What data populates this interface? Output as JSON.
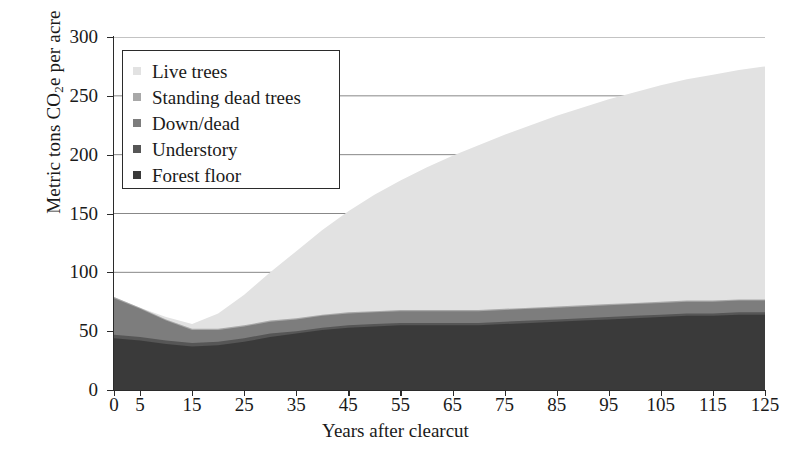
{
  "chart_data": {
    "type": "area",
    "stacked": true,
    "title": "",
    "xlabel": "Years after clearcut",
    "ylabel": "Metric tons CO2e per acre",
    "ylabel_parts": {
      "pre": "Metric tons CO",
      "sub": "2",
      "post": "e per acre"
    },
    "xlim": [
      0,
      125
    ],
    "ylim": [
      0,
      300
    ],
    "yticks": [
      0,
      50,
      100,
      150,
      200,
      250,
      300
    ],
    "xticks": [
      0,
      5,
      15,
      25,
      35,
      45,
      55,
      65,
      75,
      85,
      95,
      105,
      115,
      125
    ],
    "grid": "horizontal",
    "legend_position": "upper-left-inside",
    "x": [
      0,
      5,
      10,
      15,
      20,
      25,
      30,
      35,
      40,
      45,
      50,
      55,
      60,
      65,
      70,
      75,
      80,
      85,
      90,
      95,
      100,
      105,
      110,
      115,
      120,
      125
    ],
    "series": [
      {
        "name": "Forest floor",
        "color": "#3a3a3a",
        "values": [
          44,
          42,
          39,
          37,
          38,
          41,
          45,
          48,
          51,
          53,
          54,
          55,
          55,
          55,
          55,
          56,
          57,
          58,
          59,
          60,
          61,
          62,
          63,
          63,
          64,
          64
        ]
      },
      {
        "name": "Understory",
        "color": "#565656",
        "values": [
          3,
          3,
          3,
          3,
          3,
          3,
          3,
          2,
          2,
          2,
          2,
          2,
          2,
          2,
          2,
          2,
          2,
          2,
          2,
          2,
          2,
          2,
          2,
          2,
          2,
          2
        ]
      },
      {
        "name": "Down/dead",
        "color": "#7d7d7d",
        "values": [
          31,
          24,
          17,
          11,
          10,
          10,
          10,
          10,
          10,
          10,
          10,
          10,
          10,
          10,
          10,
          10,
          10,
          10,
          10,
          10,
          10,
          10,
          10,
          10,
          10,
          10
        ]
      },
      {
        "name": "Standing dead trees",
        "color": "#a8a8a8",
        "values": [
          1,
          1,
          1,
          1,
          1,
          1,
          1,
          1,
          1,
          1,
          1,
          1,
          1,
          1,
          1,
          1,
          1,
          1,
          1,
          1,
          1,
          1,
          1,
          1,
          1,
          1
        ]
      },
      {
        "name": "Live trees",
        "color": "#e2e2e2",
        "values": [
          0,
          0,
          2,
          4,
          13,
          26,
          41,
          57,
          72,
          86,
          99,
          110,
          121,
          131,
          140,
          148,
          155,
          162,
          168,
          174,
          179,
          184,
          188,
          192,
          195,
          198
        ]
      }
    ],
    "totals": [
      79,
      70,
      62,
      56,
      65,
      81,
      100,
      118,
      136,
      152,
      166,
      178,
      189,
      199,
      208,
      217,
      225,
      233,
      240,
      247,
      253,
      259,
      264,
      268,
      272,
      275
    ]
  },
  "legend": {
    "items": [
      {
        "label": "Live trees",
        "color": "#e2e2e2"
      },
      {
        "label": "Standing dead trees",
        "color": "#a8a8a8"
      },
      {
        "label": "Down/dead",
        "color": "#7d7d7d"
      },
      {
        "label": "Understory",
        "color": "#565656"
      },
      {
        "label": "Forest floor",
        "color": "#3a3a3a"
      }
    ]
  },
  "colors": {
    "axis": "#2b2b2b",
    "grid": "#7a7a7a",
    "background": "#ffffff"
  }
}
